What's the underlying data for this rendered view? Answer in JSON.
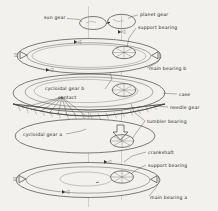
{
  "figure": {
    "background_color": "#f2f1ee",
    "line_color": "#3a3733",
    "text_color": "#262420",
    "axis_color": "#9b9a96"
  },
  "labels": {
    "sun_gear": "sun gear",
    "planet_gear": "planet gear",
    "support_bearing_top": "support bearing",
    "main_bearing_b": "main bearing b",
    "cycloidal_gear_b": "cycloidal gear b",
    "contact": "contact",
    "case": "case",
    "needle_gear": "needle gear",
    "cycloidal_gear_a": "cycloidal gear a",
    "tumbler_bearing": "tumbler bearing",
    "crankshaft": "crankshaft",
    "support_bearing_bottom": "support bearing",
    "main_bearing_a": "main bearing a"
  },
  "components": [
    {
      "name": "sun gear",
      "kind": "gear",
      "layer": 0
    },
    {
      "name": "planet gear",
      "kind": "gear",
      "layer": 0
    },
    {
      "name": "support bearing",
      "kind": "bearing",
      "layer": 1
    },
    {
      "name": "main bearing b",
      "kind": "bearing-disc",
      "layer": 1
    },
    {
      "name": "case",
      "kind": "housing",
      "layer": 2
    },
    {
      "name": "cycloidal gear b",
      "kind": "disc",
      "layer": 2
    },
    {
      "name": "contact",
      "kind": "annotation",
      "layer": 2
    },
    {
      "name": "needle gear",
      "kind": "ring",
      "layer": 3
    },
    {
      "name": "cycloidal gear a",
      "kind": "disc",
      "layer": 4
    },
    {
      "name": "tumbler bearing",
      "kind": "bearing",
      "layer": 4
    },
    {
      "name": "crankshaft",
      "kind": "shaft",
      "layer": 4
    },
    {
      "name": "support bearing",
      "kind": "bearing",
      "layer": 5
    },
    {
      "name": "main bearing a",
      "kind": "bearing-disc",
      "layer": 5
    }
  ]
}
